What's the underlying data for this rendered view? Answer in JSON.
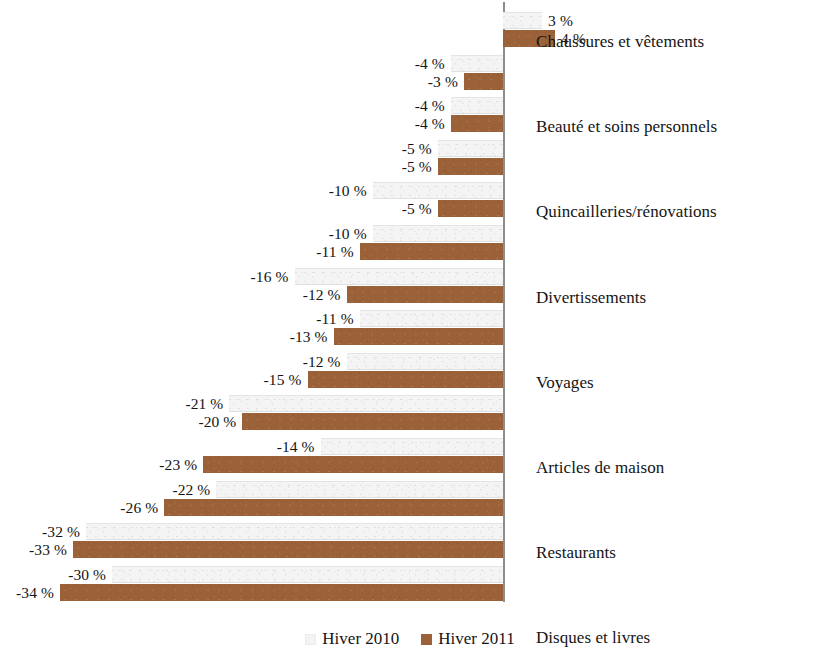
{
  "chart_data": {
    "type": "bar",
    "orientation": "horizontal",
    "title": "",
    "subtitle": "",
    "xlabel": "",
    "ylabel": "",
    "grid": false,
    "legend_position": "bottom",
    "value_suffix": " %",
    "axis_zero": 0,
    "xlim": [
      -36,
      8
    ],
    "categories": [
      "Chaussures et vêtements",
      "Beauté et soins personnels",
      "Quincailleries/rénovations",
      "Divertissements",
      "Voyages",
      "Articles de maison",
      "Restaurants",
      "Disques et livres",
      "Articles de sport",
      "Meubles et électroménagers",
      "Jouets",
      "Matériel informatique",
      "Appareils électroniques portatifs",
      "Appareils audio ou vidéo"
    ],
    "series": [
      {
        "name": "Hiver 2010",
        "color": "#f3f3f3",
        "values": [
          3,
          -4,
          -4,
          -5,
          -10,
          -10,
          -16,
          -11,
          -12,
          -21,
          -14,
          -22,
          -32,
          -30
        ],
        "labels": [
          "3 %",
          "-4 %",
          "-4 %",
          "-5 %",
          "-10 %",
          "-10 %",
          "-16 %",
          "-11 %",
          "-12 %",
          "-21 %",
          "-14 %",
          "-22 %",
          "-32 %",
          "-30 %"
        ]
      },
      {
        "name": "Hiver 2011",
        "color": "#9b6239",
        "values": [
          4,
          -3,
          -4,
          -5,
          -5,
          -11,
          -12,
          -13,
          -15,
          -20,
          -23,
          -26,
          -33,
          -34
        ],
        "labels": [
          "4 %",
          "-3 %",
          "-4 %",
          "-5 %",
          "-5 %",
          "-11 %",
          "-12 %",
          "-13 %",
          "-15 %",
          "-20 %",
          "-23 %",
          "-26 %",
          "-33 %",
          "-34 %"
        ]
      }
    ]
  },
  "legend": {
    "items": [
      {
        "label": "Hiver 2010",
        "swatch": "legend-swatch-2010"
      },
      {
        "label": "Hiver 2011",
        "swatch": "legend-swatch-2011"
      }
    ]
  }
}
